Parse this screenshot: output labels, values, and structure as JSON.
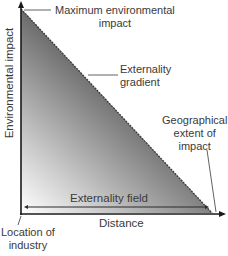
{
  "diagram": {
    "type": "externality-gradient",
    "axes": {
      "x_label": "Distance",
      "y_label": "Environmental impact"
    },
    "annotations": {
      "max_impact_line1": "Maximum environmental",
      "max_impact_line2": "impact",
      "gradient_line1": "Externality",
      "gradient_line2": "gradient",
      "extent_line1": "Geographical",
      "extent_line2": "extent of",
      "extent_line3": "impact",
      "field": "Externality field",
      "origin_line1": "Location of",
      "origin_line2": "industry"
    },
    "colors": {
      "gradient_dark": "#5a5a5a",
      "gradient_light": "#ffffff",
      "axis": "#1a1a1a",
      "text": "#3a3a3a"
    }
  }
}
